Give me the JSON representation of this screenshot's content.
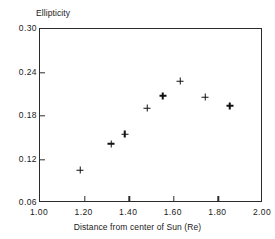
{
  "chart_data": {
    "type": "scatter",
    "title": "",
    "xlabel": "Distance from center of Sun (Re)",
    "ylabel": "Ellipticity",
    "xlim": [
      1.0,
      2.0
    ],
    "ylim": [
      0.06,
      0.3
    ],
    "grid": false,
    "legend": null,
    "marker": "plus",
    "marker_color": "#111111",
    "xticks": [
      1.0,
      1.2,
      1.4,
      1.6,
      1.8,
      2.0
    ],
    "xtick_labels": [
      "1.00",
      "1.20",
      "1.40",
      "1.60",
      "1.80",
      "2.00"
    ],
    "yticks": [
      0.06,
      0.12,
      0.18,
      0.24,
      0.3
    ],
    "ytick_labels": [
      "0.06",
      "0.12",
      "0.18",
      "0.24",
      "0.30"
    ],
    "points": [
      {
        "x": 1.18,
        "y": 0.105
      },
      {
        "x": 1.32,
        "y": 0.142
      },
      {
        "x": 1.38,
        "y": 0.155
      },
      {
        "x": 1.48,
        "y": 0.191
      },
      {
        "x": 1.55,
        "y": 0.208
      },
      {
        "x": 1.63,
        "y": 0.228
      },
      {
        "x": 1.74,
        "y": 0.206
      },
      {
        "x": 1.85,
        "y": 0.194
      }
    ]
  }
}
